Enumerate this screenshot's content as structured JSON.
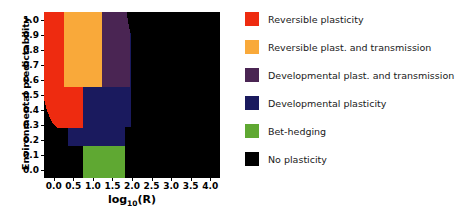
{
  "chart_data": {
    "type": "heatmap",
    "title": "",
    "xlabel": "log10(R)",
    "xlabel_base": "log",
    "xlabel_sub": "10",
    "xlabel_tail": "(R)",
    "ylabel": "Environmental predictability",
    "xlim": [
      -0.25,
      4.25
    ],
    "ylim": [
      -0.05,
      1.05
    ],
    "xticks": [
      "0.0",
      "0.5",
      "1.0",
      "1.5",
      "2.0",
      "2.5",
      "3.0",
      "3.5",
      "4.0"
    ],
    "xtick_values": [
      0.0,
      0.5,
      1.0,
      1.5,
      2.0,
      2.5,
      3.0,
      3.5,
      4.0
    ],
    "yticks": [
      "0.0",
      "0.1",
      "0.2",
      "0.3",
      "0.4",
      "0.5",
      "0.6",
      "0.7",
      "0.8",
      "0.9",
      "1.0"
    ],
    "ytick_values": [
      0.0,
      0.1,
      0.2,
      0.3,
      0.4,
      0.5,
      0.6,
      0.7,
      0.8,
      0.9,
      1.0
    ],
    "grid": false,
    "legend_position": "right",
    "categories": [
      {
        "key": "reversible_plasticity",
        "label": "Reversible plasticity",
        "color": "#EE2B10"
      },
      {
        "key": "reversible_plast_transmission",
        "label": "Reversible plast. and transmission",
        "color": "#F9A93A"
      },
      {
        "key": "developmental_plast_transmission",
        "label": "Developmental plast. and transmission",
        "color": "#4A2553"
      },
      {
        "key": "developmental_plasticity",
        "label": "Developmental plasticity",
        "color": "#1A1A5E"
      },
      {
        "key": "bet_hedging",
        "label": "Bet-hedging",
        "color": "#5FA832"
      },
      {
        "key": "no_plasticity",
        "label": "No plasticity",
        "color": "#000000"
      }
    ],
    "background_category": "no_plasticity",
    "regions": [
      {
        "category": "reversible_plasticity",
        "comment": "Red region: left column, high predictability down to ~0.28, rounded lower-left corner",
        "points": [
          [
            -0.25,
            1.05
          ],
          [
            0.27,
            1.05
          ],
          [
            0.27,
            0.55
          ],
          [
            0.75,
            0.55
          ],
          [
            0.75,
            0.28
          ],
          [
            0.1,
            0.28
          ],
          [
            -0.03,
            0.31
          ],
          [
            -0.12,
            0.36
          ],
          [
            -0.2,
            0.42
          ],
          [
            -0.25,
            0.47
          ]
        ]
      },
      {
        "category": "reversible_plast_transmission",
        "comment": "Orange region: second column band, predictability 0.555 to 1.0",
        "points": [
          [
            0.27,
            1.05
          ],
          [
            1.23,
            1.05
          ],
          [
            1.23,
            0.555
          ],
          [
            0.27,
            0.555
          ]
        ]
      },
      {
        "category": "developmental_plast_transmission",
        "comment": "Purple region: third band with diagonal upper-right edge",
        "points": [
          [
            1.23,
            1.05
          ],
          [
            1.86,
            1.05
          ],
          [
            1.94,
            0.93
          ],
          [
            1.94,
            0.555
          ],
          [
            1.23,
            0.555
          ]
        ]
      },
      {
        "category": "developmental_plasticity",
        "comment": "Navy region: mid block under orange/purple plus lower tongue",
        "points": [
          [
            0.75,
            0.555
          ],
          [
            1.94,
            0.555
          ],
          [
            1.94,
            0.93
          ],
          [
            1.98,
            0.9
          ],
          [
            1.98,
            0.29
          ],
          [
            1.82,
            0.29
          ],
          [
            1.82,
            0.16
          ],
          [
            0.75,
            0.16
          ],
          [
            0.37,
            0.16
          ],
          [
            0.37,
            0.28
          ],
          [
            0.75,
            0.28
          ]
        ]
      },
      {
        "category": "bet_hedging",
        "comment": "Green block: low predictability, mid R",
        "points": [
          [
            0.75,
            0.16
          ],
          [
            1.82,
            0.16
          ],
          [
            1.82,
            -0.05
          ],
          [
            0.75,
            -0.05
          ]
        ]
      }
    ]
  },
  "legend": {
    "items": [
      {
        "label": "Reversible plasticity",
        "color": "#EE2B10"
      },
      {
        "label": "Reversible plast. and transmission",
        "color": "#F9A93A"
      },
      {
        "label": "Developmental plast. and transmission",
        "color": "#4A2553"
      },
      {
        "label": "Developmental plasticity",
        "color": "#1A1A5E"
      },
      {
        "label": "Bet-hedging",
        "color": "#5FA832"
      },
      {
        "label": "No plasticity",
        "color": "#000000"
      }
    ]
  }
}
